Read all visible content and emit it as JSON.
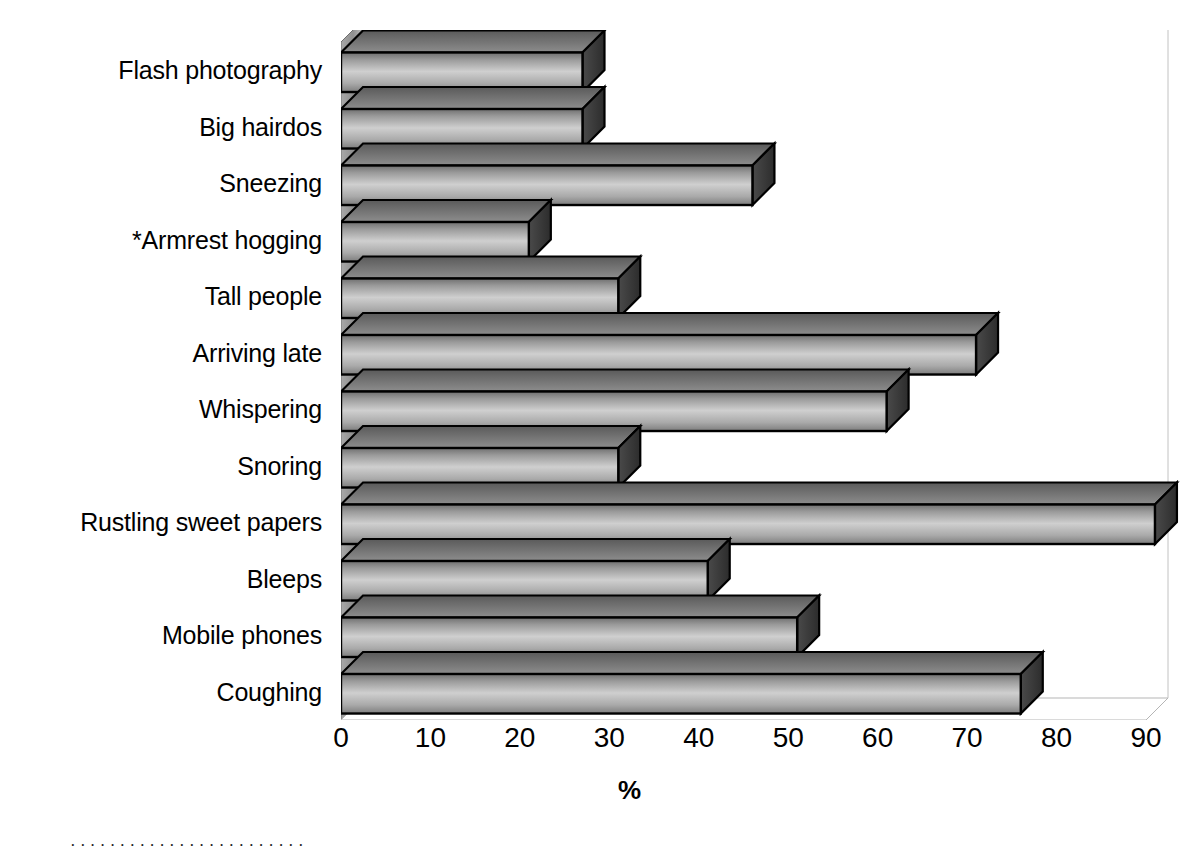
{
  "chart_data": {
    "type": "bar",
    "orientation": "horizontal",
    "title": "",
    "xlabel": "%",
    "ylabel": "",
    "xlim": [
      0,
      90
    ],
    "xticks": [
      0,
      10,
      20,
      30,
      40,
      50,
      60,
      70,
      80,
      90
    ],
    "grid": false,
    "legend": null,
    "style_3d": true,
    "categories": [
      "Flash photography",
      "Big hairdos",
      "Sneezing",
      "*Armrest hogging",
      "Tall people",
      "Arriving late",
      "Whispering",
      "Snoring",
      "Rustling sweet papers",
      "Bleeps",
      "Mobile phones",
      "Coughing"
    ],
    "values": [
      27,
      27,
      46,
      21,
      31,
      71,
      61,
      31,
      91,
      41,
      51,
      76
    ],
    "annotations": [
      "*Armrest hogging is marked with an asterisk"
    ]
  },
  "axis": {
    "x_title": "%",
    "tick_labels": [
      "0",
      "10",
      "20",
      "30",
      "40",
      "50",
      "60",
      "70",
      "80",
      "90"
    ]
  },
  "caption": {
    "text": "· · · · · · · · · · · · · · · · · · · · · · · ·"
  },
  "colors": {
    "bar_face_light": "#d9d9d9",
    "bar_face_dark": "#8a8a8a",
    "bar_side": "#3c3c3c",
    "bar_top": "#6e6e6e",
    "outline": "#000000",
    "wall": "#8c8c8c",
    "floor": "#ffffff",
    "axis_line": "#4d4d4d",
    "text": "#000000"
  }
}
